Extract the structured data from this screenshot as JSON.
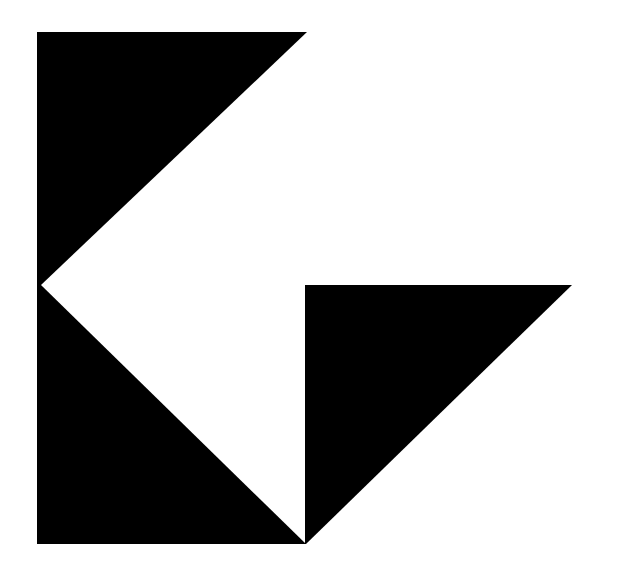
{
  "canvas": {
    "width": 619,
    "height": 583,
    "background": "#ffffff"
  },
  "logo": {
    "description": "Geometric black logo: a left block with a white arrow notch and a right-pointing lower triangle",
    "fill_color": "#000000",
    "shapes": [
      {
        "name": "left-block-upper",
        "points": "37,32 307,32 41,285 37,285"
      },
      {
        "name": "left-block-lower",
        "points": "37,285 41,285 306,544 37,544"
      },
      {
        "name": "right-triangle",
        "points": "305,285 572,285 306,544 305,544"
      }
    ]
  }
}
